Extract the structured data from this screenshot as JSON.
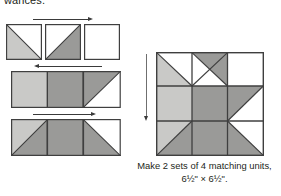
{
  "page": {
    "clipped_top_text": "wances.",
    "background": "#ffffff",
    "ink": "#231f20"
  },
  "palette": {
    "white": "#ffffff",
    "light_gray": "#c9c9c7",
    "medium_gray": "#9a9a98",
    "outline": "#3f3f3f",
    "arrow": "#3a3a3a",
    "arrow_soft": "#6f6f6f"
  },
  "caption": {
    "line1": "Make 2 sets of 4 matching units,",
    "line2": "6½\" × 6½\"."
  },
  "steps": [
    {
      "name": "step-1",
      "arrow": {
        "direction": "right",
        "label": "press-right-arrow"
      },
      "units": [
        {
          "name": "half-square-triangle-light",
          "triangle": "bottom-left",
          "fill": "light_gray",
          "ground": "white"
        },
        {
          "name": "half-square-triangle-medium",
          "triangle": "bottom-left",
          "fill": "medium_gray",
          "ground": "white"
        },
        {
          "name": "plain-square-white",
          "triangle": "none",
          "fill": "white",
          "ground": "white"
        }
      ]
    },
    {
      "name": "step-2",
      "arrow": {
        "direction": "left",
        "label": "press-left-arrow"
      },
      "units": [
        {
          "name": "plain-square-light",
          "triangle": "none",
          "fill": "light_gray",
          "ground": "light_gray"
        },
        {
          "name": "plain-square-medium",
          "triangle": "none",
          "fill": "medium_gray",
          "ground": "medium_gray"
        },
        {
          "name": "half-square-triangle-medium",
          "triangle": "top-left",
          "fill": "medium_gray",
          "ground": "white"
        }
      ]
    },
    {
      "name": "step-3",
      "arrow": {
        "direction": "right",
        "label": "press-right-arrow"
      },
      "units": [
        {
          "name": "flying-geese-left",
          "triangle": "center",
          "fill": "medium_gray",
          "ground": "light_gray"
        },
        {
          "name": "plain-square-medium",
          "triangle": "none",
          "fill": "medium_gray",
          "ground": "medium_gray"
        },
        {
          "name": "flying-geese-right",
          "triangle": "center",
          "fill": "medium_gray",
          "ground": "white"
        }
      ]
    }
  ],
  "block": {
    "name": "finished-quilt-block",
    "arrow": {
      "direction": "down",
      "label": "block-height-arrow"
    },
    "size_label": "6½\" × 6½\"",
    "rows": 3,
    "columns": 3
  }
}
